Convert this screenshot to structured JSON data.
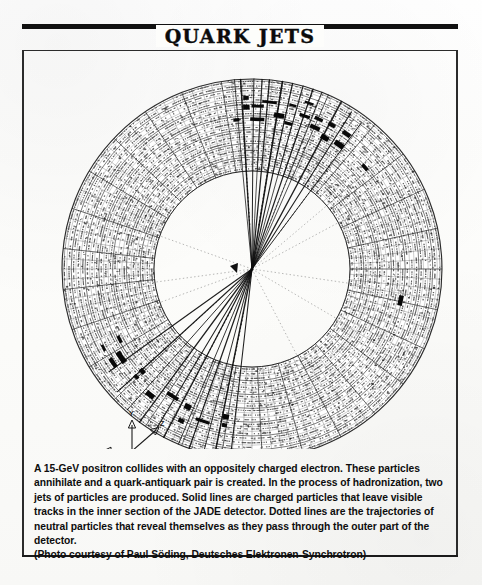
{
  "figure": {
    "title": "QUARK JETS",
    "caption_body": "A 15-GeV positron collides with an oppositely charged electron. These particles annihilate and a quark-antiquark pair is created. In the process of hadronization, two jets of particles are produced. Solid lines are charged particles that leave visible tracks in the inner section of the JADE detector. Dotted lines are the trajectories of neutral particles that reveal themselves as they pass through the outer part of the detector.",
    "caption_credit": "(Photo courtesy of Paul Söding, Deutsches Elektronen-Synchrotron)"
  },
  "event_display": {
    "detector_name": "JADE detector",
    "center": {
      "x": 228,
      "y": 218
    },
    "radii": {
      "inner": 98,
      "outer": 190
    },
    "colors": {
      "ink": "#111111",
      "paper": "#fdfdfb",
      "cell_line": "#3a3a3a",
      "hit": "#0a0a0a"
    },
    "axis_indicator": {
      "origin": {
        "x": 108,
        "y": 400
      },
      "labels": {
        "x": "X",
        "y": "Y",
        "z": "Z"
      }
    },
    "jets": [
      {
        "name": "jet-upper",
        "direction_deg": -78,
        "track_count": 14
      },
      {
        "name": "jet-lower",
        "direction_deg": 118,
        "track_count": 11
      }
    ]
  },
  "chart_data": {
    "type": "scatter",
    "title": "QUARK JETS",
    "xlabel": "",
    "ylabel": "",
    "annotations": [
      "X",
      "Y",
      "Z"
    ],
    "legend": [
      "Solid lines: charged particle tracks (inner detector)",
      "Dotted lines: neutral particle trajectories (outer detector)"
    ],
    "series": [
      {
        "name": "jet-upper-tracks",
        "angles_deg": [
          -96,
          -93,
          -90,
          -87,
          -84,
          -81,
          -78,
          -75,
          -72,
          -69,
          -66,
          -62,
          -58,
          -53
        ],
        "lengths_px": [
          190,
          190,
          190,
          190,
          190,
          190,
          190,
          190,
          190,
          190,
          190,
          190,
          186,
          182
        ]
      },
      {
        "name": "jet-lower-tracks",
        "angles_deg": [
          96,
          101,
          105,
          109,
          113,
          117,
          121,
          126,
          131,
          137,
          145
        ],
        "lengths_px": [
          188,
          190,
          190,
          190,
          190,
          190,
          190,
          190,
          188,
          182,
          176
        ]
      },
      {
        "name": "calorimeter-hits",
        "angles_deg": [
          -96,
          -92,
          -88,
          -84,
          -80,
          -76,
          -71,
          -66,
          -61,
          -55,
          -42,
          100,
          108,
          115,
          122,
          129,
          137,
          146,
          152,
          12
        ],
        "radii_px": [
          150,
          162,
          150,
          168,
          156,
          150,
          162,
          155,
          150,
          152,
          152,
          150,
          160,
          152,
          150,
          162,
          150,
          158,
          150,
          152
        ]
      }
    ]
  }
}
